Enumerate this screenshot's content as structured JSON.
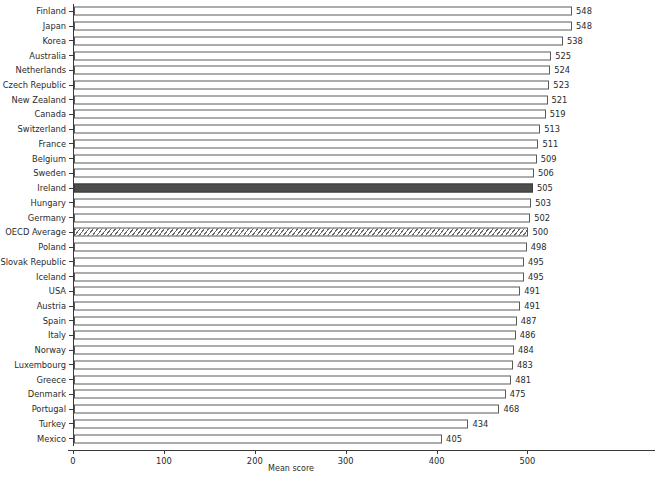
{
  "chart_data": {
    "type": "bar",
    "orientation": "horizontal",
    "title": "",
    "xlabel": "Mean score",
    "ylabel": "",
    "xlim": [
      0,
      560
    ],
    "xticks": [
      0,
      100,
      200,
      300,
      400,
      500
    ],
    "grid": false,
    "legend": null,
    "categories": [
      "Finland",
      "Japan",
      "Korea",
      "Australia",
      "Netherlands",
      "Czech Republic",
      "New Zealand",
      "Canada",
      "Switzerland",
      "France",
      "Belgium",
      "Sweden",
      "Ireland",
      "Hungary",
      "Germany",
      "OECD Average",
      "Poland",
      "Slovak Republic",
      "Iceland",
      "USA",
      "Austria",
      "Spain",
      "Italy",
      "Norway",
      "Luxembourg",
      "Greece",
      "Denmark",
      "Portugal",
      "Turkey",
      "Mexico"
    ],
    "values": [
      548,
      548,
      538,
      525,
      524,
      523,
      521,
      519,
      513,
      511,
      509,
      506,
      505,
      503,
      502,
      500,
      498,
      495,
      495,
      491,
      491,
      487,
      486,
      484,
      483,
      481,
      475,
      468,
      434,
      405
    ],
    "highlighted": [
      "Ireland"
    ],
    "hatched": [
      "OECD Average"
    ],
    "styles": {
      "bar_fill": "#ffffff",
      "bar_border": "#5a5a5a",
      "highlight_fill": "#4d4d4d",
      "hatch_stroke": "#6a6a6a",
      "axis_color": "#3a3a3a",
      "text_color": "#2b2b2b"
    }
  }
}
